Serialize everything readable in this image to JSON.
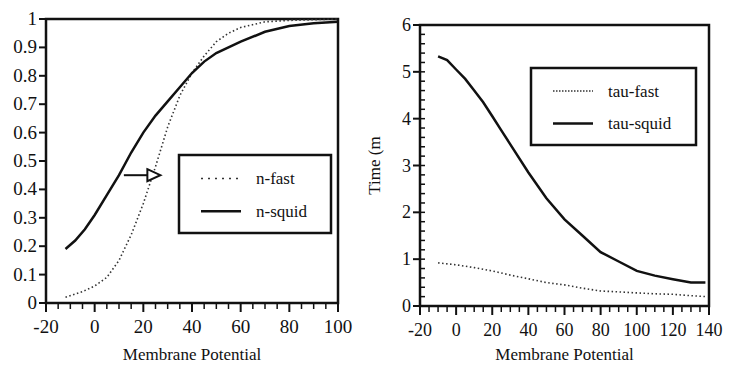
{
  "chart_data": [
    {
      "type": "line",
      "title": "",
      "xlabel": "Membrane Potential",
      "ylabel": "",
      "xlim": [
        -20,
        100
      ],
      "ylim": [
        0,
        1
      ],
      "xticks": [
        -20,
        0,
        20,
        40,
        60,
        80,
        100
      ],
      "yticks": [
        0,
        0.1,
        0.2,
        0.3,
        0.4,
        0.5,
        0.6,
        0.7,
        0.8,
        0.9,
        1
      ],
      "ytick_labels": [
        "0",
        "0.1",
        "0.2",
        "0.3",
        "0.4",
        "0.5",
        "0.6",
        "0.7",
        "0.8",
        "0.9",
        "1"
      ],
      "grid": false,
      "legend_position": "center-right",
      "annotations": [
        {
          "type": "arrow",
          "from": [
            12,
            0.45
          ],
          "to": [
            27,
            0.45
          ],
          "note": "right shift from n-squid to n-fast"
        }
      ],
      "series": [
        {
          "name": "n-fast",
          "style": "dotted",
          "x": [
            -12,
            -5,
            0,
            5,
            10,
            15,
            20,
            25,
            30,
            35,
            40,
            45,
            50,
            55,
            60,
            70,
            80,
            100
          ],
          "y": [
            0.02,
            0.04,
            0.06,
            0.09,
            0.15,
            0.24,
            0.35,
            0.48,
            0.62,
            0.73,
            0.81,
            0.87,
            0.92,
            0.95,
            0.97,
            0.99,
            0.995,
            1.0
          ]
        },
        {
          "name": "n-squid",
          "style": "solid",
          "x": [
            -12,
            -8,
            -4,
            0,
            5,
            10,
            15,
            20,
            25,
            30,
            35,
            40,
            45,
            50,
            60,
            70,
            80,
            90,
            100
          ],
          "y": [
            0.19,
            0.22,
            0.26,
            0.31,
            0.38,
            0.45,
            0.53,
            0.6,
            0.66,
            0.71,
            0.76,
            0.81,
            0.85,
            0.88,
            0.92,
            0.955,
            0.975,
            0.985,
            0.99
          ]
        }
      ]
    },
    {
      "type": "line",
      "title": "",
      "xlabel": "Membrane Potential",
      "ylabel": "Time (m",
      "xlim": [
        -20,
        140
      ],
      "ylim": [
        0,
        6
      ],
      "xticks": [
        -20,
        0,
        20,
        40,
        60,
        80,
        100,
        120,
        140
      ],
      "yticks": [
        0,
        1,
        2,
        3,
        4,
        5,
        6
      ],
      "ytick_labels": [
        "0",
        "1",
        "2",
        "3",
        "4",
        "5",
        "6"
      ],
      "grid": false,
      "legend_position": "upper-right",
      "series": [
        {
          "name": "tau-fast",
          "style": "dotted",
          "x": [
            -10,
            0,
            10,
            20,
            30,
            40,
            50,
            60,
            70,
            80,
            90,
            100,
            110,
            120,
            130,
            138
          ],
          "y": [
            0.92,
            0.88,
            0.82,
            0.75,
            0.66,
            0.58,
            0.5,
            0.45,
            0.38,
            0.32,
            0.3,
            0.28,
            0.26,
            0.25,
            0.22,
            0.2
          ]
        },
        {
          "name": "tau-squid",
          "style": "solid",
          "x": [
            -10,
            -5,
            0,
            5,
            10,
            15,
            20,
            25,
            30,
            40,
            50,
            60,
            70,
            80,
            90,
            100,
            110,
            120,
            130,
            138
          ],
          "y": [
            5.33,
            5.25,
            5.05,
            4.85,
            4.6,
            4.35,
            4.05,
            3.75,
            3.45,
            2.85,
            2.3,
            1.85,
            1.5,
            1.15,
            0.95,
            0.75,
            0.65,
            0.57,
            0.5,
            0.5
          ]
        }
      ]
    }
  ]
}
